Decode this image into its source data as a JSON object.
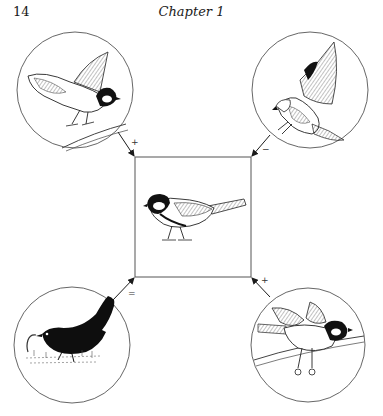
{
  "page": {
    "number": "14",
    "running_head": "Chapter 1"
  },
  "figure": {
    "center": {
      "label": "great-tit",
      "description": "Great tit perched (central focal species)"
    },
    "panels": [
      {
        "position": "top-left",
        "description": "Great tit taking off from branch",
        "sign": "+"
      },
      {
        "position": "top-right",
        "description": "Sparrowhawk swooping with talons extended",
        "sign": "−"
      },
      {
        "position": "bottom-left",
        "description": "Blackbird pulling worm from grass",
        "sign": "="
      },
      {
        "position": "bottom-right",
        "description": "Great tit landing on branch with wings raised",
        "sign": "+"
      }
    ],
    "colors": {
      "ink": "#1a1a1a",
      "line": "#555555",
      "paper": "#ffffff"
    }
  }
}
